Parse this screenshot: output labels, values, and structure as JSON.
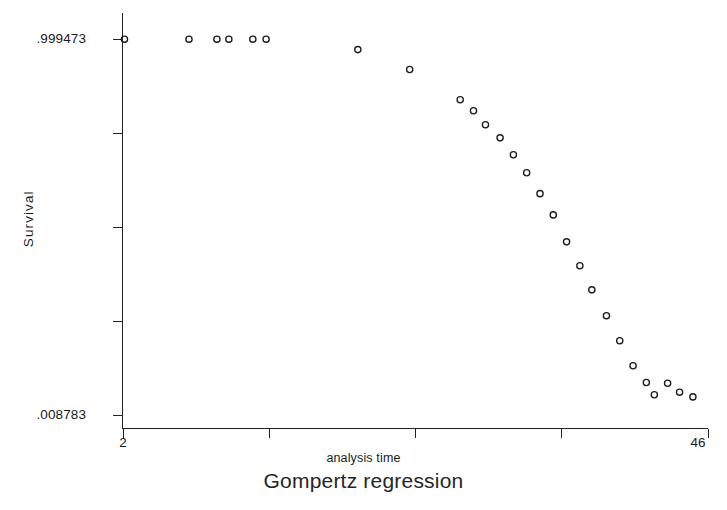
{
  "figure": {
    "caption": "Gompertz regression",
    "background_color": "#ffffff",
    "ink_color": "#1a1a1a"
  },
  "axes": {
    "y_title": "Survival",
    "x_title": "analysis time",
    "y_tick_top_label": ".999473",
    "y_tick_bottom_label": ".008783",
    "x_tick_left_label": "2",
    "x_tick_right_label": "46"
  },
  "chart_data": {
    "type": "scatter",
    "title": "Gompertz regression",
    "subtitle": "",
    "xlabel": "analysis time",
    "ylabel": "Survival",
    "xlim": [
      2,
      46
    ],
    "ylim": [
      0.008783,
      0.999473
    ],
    "grid": false,
    "legend": null,
    "marker": "open-circle",
    "marker_color": "#1c1c1c",
    "x_ticks": [
      2,
      13,
      24,
      35,
      46
    ],
    "x_tick_labels": [
      "2",
      "",
      "",
      "",
      "46"
    ],
    "y_ticks": [
      0.008783,
      0.256,
      0.503,
      0.751,
      0.999473
    ],
    "y_tick_labels": [
      ".008783",
      "",
      "",
      "",
      ".999473"
    ],
    "series": [
      {
        "name": "Survival",
        "x": [
          2.15,
          7.0,
          9.1,
          10.0,
          11.8,
          12.8,
          19.7,
          23.6,
          27.4,
          28.4,
          29.3,
          30.4,
          31.4,
          32.4,
          33.4,
          34.4,
          35.4,
          36.4,
          37.3,
          38.4,
          39.4,
          40.4,
          41.4,
          42.0,
          43.0,
          43.9,
          44.9
        ],
        "y": [
          0.999,
          0.999,
          0.999,
          0.999,
          0.999,
          0.999,
          0.9715,
          0.919,
          0.8395,
          0.8105,
          0.7735,
          0.739,
          0.6945,
          0.647,
          0.592,
          0.536,
          0.465,
          0.402,
          0.3385,
          0.2705,
          0.2045,
          0.1385,
          0.0945,
          0.062,
          0.0925,
          0.069,
          0.0565
        ],
        "n_points": 27
      }
    ]
  }
}
